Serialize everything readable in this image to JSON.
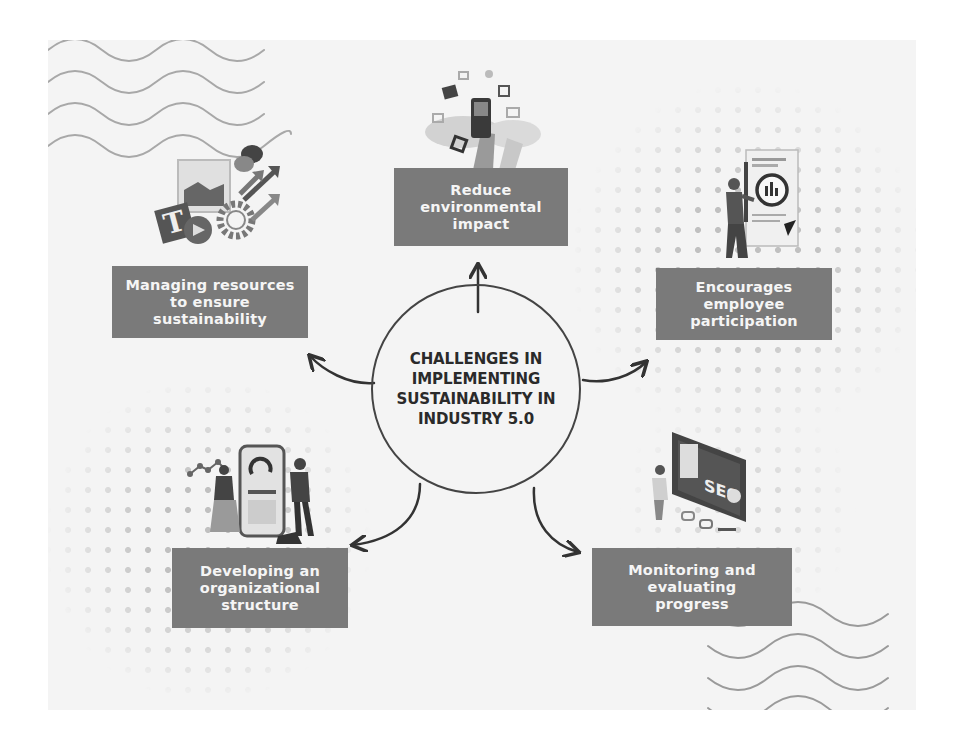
{
  "diagram": {
    "type": "radial-mind-map",
    "center": {
      "title": "CHALLENGES IN IMPLEMENTING SUSTAINABILITY IN INDUSTRY 5.0",
      "lines": [
        "CHALLENGES IN",
        "IMPLEMENTING",
        "SUSTAINABILITY IN",
        "INDUSTRY 5.0"
      ]
    },
    "nodes": [
      {
        "id": "reduce-environmental-impact",
        "label": "Reduce environmental impact",
        "lines": [
          "Reduce",
          "environmental",
          "impact"
        ],
        "position": "top",
        "icon": "person-holding-phone-with-floating-media-icon"
      },
      {
        "id": "encourages-employee-participation",
        "label": "Encourages employee participation",
        "lines": [
          "Encourages",
          "employee",
          "participation"
        ],
        "position": "right",
        "icon": "person-presenting-bar-chart-document-icon"
      },
      {
        "id": "monitoring-evaluating-progress",
        "label": "Monitoring and evaluating progress",
        "lines": [
          "Monitoring and",
          "evaluating",
          "progress"
        ],
        "position": "bottom-right",
        "icon": "person-with-seo-monitor-icon",
        "icon_text": "SEO"
      },
      {
        "id": "developing-organizational-structure",
        "label": "Developing an organizational structure",
        "lines": [
          "Developing an",
          "organizational",
          "structure"
        ],
        "position": "bottom-left",
        "icon": "team-around-smartphone-dashboard-icon"
      },
      {
        "id": "managing-resources-sustainability",
        "label": "Managing resources to ensure sustainability",
        "lines": [
          "Managing resources",
          "to ensure",
          "sustainability"
        ],
        "position": "left",
        "icon": "content-tools-gear-arrows-icon",
        "icon_text": "T"
      }
    ],
    "edges": [
      {
        "from": "center",
        "to": "reduce-environmental-impact",
        "style": "straight-arrow"
      },
      {
        "from": "center",
        "to": "encourages-employee-participation",
        "style": "curved-arrow"
      },
      {
        "from": "center",
        "to": "monitoring-evaluating-progress",
        "style": "curved-arrow"
      },
      {
        "from": "center",
        "to": "developing-organizational-structure",
        "style": "curved-arrow"
      },
      {
        "from": "center",
        "to": "managing-resources-sustainability",
        "style": "curved-arrow"
      }
    ],
    "decorations": [
      "wavy-lines-top-left",
      "wavy-lines-bottom-right",
      "dot-halo-right",
      "dot-halo-bottom-left",
      "dot-halo-bottom-right"
    ]
  },
  "colors": {
    "background": "#f4f4f4",
    "page": "#ffffff",
    "box_fill": "#7a7a7a",
    "box_text": "#f5f5f5",
    "center_text": "#2a2a2a",
    "lines": "#333333",
    "waves": "#a8a8a8"
  }
}
